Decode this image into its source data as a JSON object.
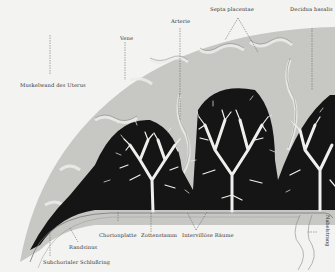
{
  "figure": {
    "labels": {
      "septa": "Septa placentae",
      "decidua": "Decidua basalis",
      "arterie": "Arterie",
      "vene": "Vene",
      "muskelwand": "Muskelwand des Uterus",
      "chorionplatte": "Chorionplatte",
      "zottenstamm": "Zottenstamm",
      "intervillose": "Intervillöse Räume",
      "randsinus": "Randsinus",
      "subchorialer": "Subchorialer Schlußring",
      "nabelstrang": "Nabelstrang"
    },
    "colors": {
      "background": "#f3f3f1",
      "muscle_wall": "#c9c9c6",
      "villi_dark": "#141414",
      "villi_branches": "#f0f0ee",
      "vessels": "#a9a9a6"
    }
  }
}
